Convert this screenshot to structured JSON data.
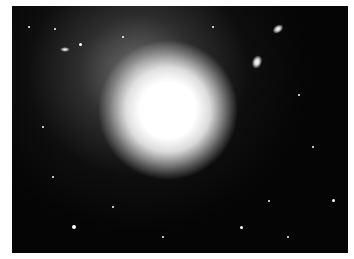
{
  "image": {
    "subject": "elliptical galaxy",
    "description": "Bright elliptical galaxy with diffuse halo on black star field, with small companion galaxies",
    "border_color": "#ffffff",
    "background_color": "#050505"
  },
  "core": {
    "cx": 168,
    "cy": 118,
    "color": "#ffffff"
  },
  "companions": [
    {
      "cx": 246,
      "cy": 56
    },
    {
      "cx": 280,
      "cy": 29
    },
    {
      "cx": 56,
      "cy": 44
    }
  ]
}
